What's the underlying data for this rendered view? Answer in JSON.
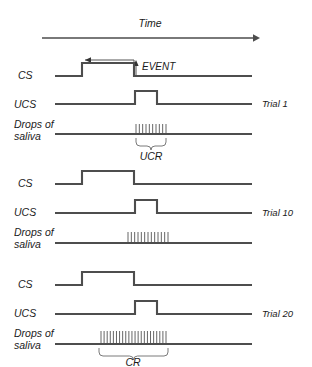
{
  "figure": {
    "title_axis": "Time",
    "event_label": "EVENT",
    "row_labels": {
      "cs": "CS",
      "ucs": "UCS",
      "saliva_line1": "Drops of",
      "saliva_line2": "saliva"
    },
    "trials": [
      {
        "name": "Trial 1",
        "response_label": "UCR",
        "cs_pulse": {
          "start": 82,
          "end": 134
        },
        "ucs_pulse": {
          "start": 135,
          "end": 157
        },
        "saliva_ticks": {
          "start": 136,
          "end": 166,
          "count": 10
        },
        "brace": {
          "start": 136,
          "end": 166
        }
      },
      {
        "name": "Trial 10",
        "response_label": "",
        "cs_pulse": {
          "start": 82,
          "end": 134
        },
        "ucs_pulse": {
          "start": 135,
          "end": 157
        },
        "saliva_ticks": {
          "start": 128,
          "end": 168,
          "count": 13
        },
        "brace": null
      },
      {
        "name": "Trial 20",
        "response_label": "CR",
        "cs_pulse": {
          "start": 82,
          "end": 134
        },
        "ucs_pulse": {
          "start": 135,
          "end": 157
        },
        "saliva_ticks": {
          "start": 101,
          "end": 166,
          "count": 22
        },
        "brace": {
          "start": 99,
          "end": 168
        }
      }
    ],
    "colors": {
      "trace": "#4d4d4d",
      "thin": "#555555",
      "brace": "#6b6b6b",
      "text": "#1a1a1a",
      "background": "#ffffff"
    },
    "geometry": {
      "time_arrow": {
        "x1": 42,
        "x2": 258,
        "y": 38
      },
      "cs_interval_arrow": {
        "x_from": 134,
        "x_to": 85,
        "y": 60
      },
      "event_arrow": {
        "x": 136,
        "y_from": 74,
        "y_to": 61
      },
      "trace_left": 55,
      "trace_right": 252,
      "pulse_height": 13
    }
  }
}
